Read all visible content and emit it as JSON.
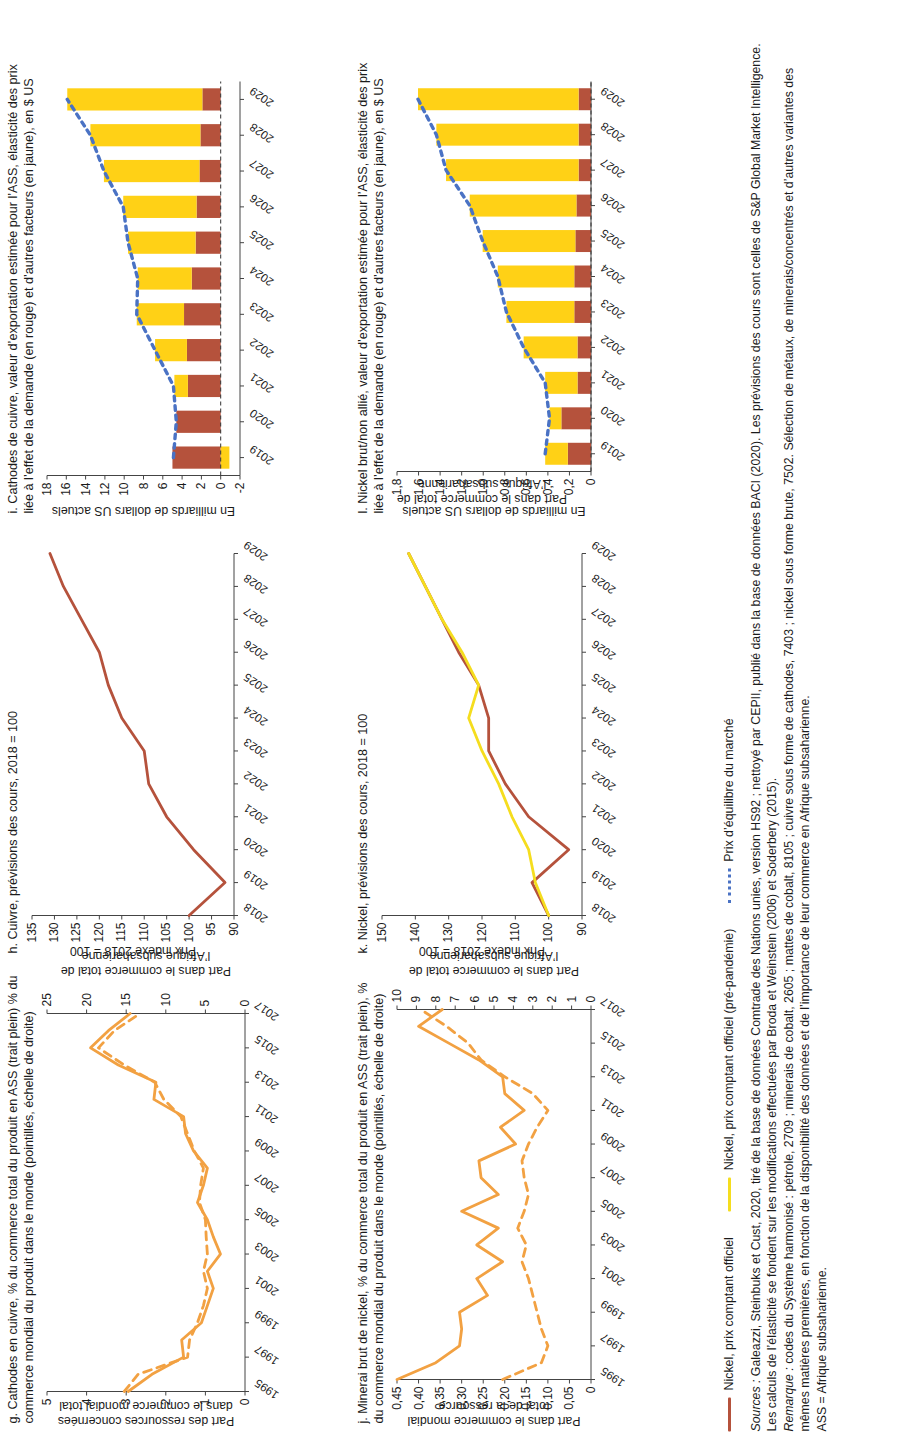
{
  "figure": {
    "legend": [
      {
        "key": "copper-spot",
        "label": "Nickel, prix comptant officiel",
        "color": "#b5523c",
        "style": "solid"
      },
      {
        "key": "nickel-spot-yellow",
        "label": "Nickel, prix comptant officiel (pré-pandémie)",
        "color": "#f5dd1e",
        "style": "solid"
      },
      {
        "key": "equilibrium",
        "label": "Prix d’équilibre du marché",
        "color": "#4a72c4",
        "style": "dotted"
      }
    ],
    "notes": {
      "sources_label": "Sources :",
      "sources_text": " Galeazzi, Steinbuks et Cust, 2020, tiré de la base de données Comtrade des Nations unies, version HS92 ; nettoyé par CEPII, publié dans la base de données BACI (2020). Les prévisions des cours sont celles de S&P Global Market Intelligence. Les calculs de l’élasticité se fondent sur les modifications effectuées par Broda et Weinstein (2006) et Soderbery (2015).",
      "remark_label": "Remarque :",
      "remark_text": " codes du Système harmonisé : pétrole, 2709 ; minerais de cobalt, 2605 ; mattes de cobalt, 8105 ; cuivre sous forme de cathodes, 7403 ; nickel sous forme brute, 7502. Sélection de métaux, de minerais/concentrés et d’autres variantes des mêmes matières premières, en fonction de la disponibilité des données et de l’importance de leur commerce en Afrique subsaharienne.",
      "abbrev": "ASS = Afrique subsaharienne."
    }
  },
  "chart_data": [
    {
      "id": "panel-g",
      "type": "line",
      "title": "g. Cathodes en cuivre, % du commerce total du produit en ASS (trait plein) % du commerce mondial du produit dans le monde (pointillés, échelle de droite)",
      "ylabel_left": "Part des ressources concernées\ndans le commerce mondial total",
      "ylabel_right": "Part dans le commerce total de\nl’Afrique subsaharienne",
      "x": [
        1995,
        1996,
        1997,
        1998,
        1999,
        2000,
        2001,
        2002,
        2003,
        2004,
        2005,
        2006,
        2007,
        2008,
        2009,
        2010,
        2011,
        2012,
        2013,
        2014,
        2015,
        2016,
        2017
      ],
      "xticks": [
        "1995",
        "1997",
        "1999",
        "2001",
        "2003",
        "2005",
        "2007",
        "2009",
        "2011",
        "2013",
        "2015",
        "2017"
      ],
      "ylim_left": [
        0,
        5
      ],
      "yticks_left": [
        0,
        1,
        2,
        3,
        4,
        5
      ],
      "ylim_right": [
        0,
        25
      ],
      "yticks_right": [
        0,
        5,
        10,
        15,
        20,
        25
      ],
      "grid": false,
      "series": [
        {
          "name": "ASS (trait plein)",
          "style": "solid",
          "color": "#f2a142",
          "axis": "left",
          "values": [
            2.95,
            2.35,
            1.55,
            1.6,
            1.1,
            0.95,
            0.8,
            0.95,
            0.62,
            0.8,
            0.95,
            1.2,
            1.05,
            0.95,
            1.3,
            1.5,
            1.55,
            2.3,
            2.25,
            3.2,
            3.9,
            3.45,
            2.9
          ]
        },
        {
          "name": "Monde (pointillés)",
          "style": "dashed",
          "color": "#f2a142",
          "axis": "left",
          "values": [
            3.05,
            2.7,
            1.45,
            1.4,
            1.2,
            1.05,
            0.95,
            1.05,
            0.95,
            0.98,
            1.0,
            1.15,
            1.12,
            1.05,
            1.28,
            1.45,
            1.62,
            2.05,
            2.28,
            3.05,
            3.7,
            3.3,
            2.65
          ]
        }
      ]
    },
    {
      "id": "panel-h",
      "type": "line",
      "title": "h. Cuivre, prévisions des cours, 2018 = 100",
      "ylabel_left": "Prix indexé 2018 = 100",
      "x": [
        2018,
        2019,
        2020,
        2021,
        2022,
        2023,
        2024,
        2025,
        2026,
        2027,
        2028,
        2029
      ],
      "xticks": [
        "2018",
        "2019",
        "2020",
        "2021",
        "2022",
        "2023",
        "2024",
        "2025",
        "2026",
        "2027",
        "2028",
        "2029"
      ],
      "ylim_left": [
        90,
        135
      ],
      "yticks_left": [
        90,
        95,
        100,
        105,
        110,
        115,
        120,
        125,
        130,
        135
      ],
      "grid": false,
      "series": [
        {
          "name": "Cuivre, prix comptant officiel",
          "style": "solid",
          "color": "#b5523c",
          "axis": "left",
          "values": [
            100,
            92,
            99,
            105,
            109,
            110,
            115,
            118,
            120,
            124,
            128,
            131
          ]
        }
      ]
    },
    {
      "id": "panel-i",
      "type": "bar",
      "title": "i. Cathodes de cuivre, valeur d’exportation estimée pour l’ASS, élasticité des prix liée à l’effet de la demande (en rouge) et d’autres facteurs (en jaune), en $ US",
      "ylabel_left": "En milliards de dollars US actuels",
      "categories": [
        "2019",
        "2020",
        "2021",
        "2022",
        "2023",
        "2024",
        "2025",
        "2026",
        "2027",
        "2028",
        "2029"
      ],
      "xticks": [
        "2019",
        "2020",
        "2021",
        "2022",
        "2023",
        "2024",
        "2025",
        "2026",
        "2027",
        "2028",
        "2029"
      ],
      "ylim_left": [
        -2,
        18
      ],
      "yticks_left": [
        -2,
        0,
        2,
        4,
        6,
        8,
        10,
        12,
        14,
        16,
        18
      ],
      "grid": false,
      "series": [
        {
          "name": "Effet de la demande (rouge)",
          "color": "#b5523c",
          "values": [
            5.0,
            4.6,
            3.4,
            3.5,
            3.8,
            3.0,
            2.6,
            2.5,
            2.2,
            2.1,
            1.9
          ]
        },
        {
          "name": "Autres facteurs (jaune)",
          "color": "#ffd116",
          "values": [
            -0.9,
            0.0,
            1.4,
            3.3,
            4.9,
            5.6,
            7.0,
            7.6,
            9.9,
            11.4,
            14.0
          ]
        },
        {
          "name": "Prix d’équilibre du marché (pointillés bleus)",
          "color": "#4a72c4",
          "style": "dotted",
          "values": [
            4.9,
            4.6,
            4.9,
            6.8,
            8.7,
            8.6,
            9.6,
            10.1,
            12.1,
            13.5,
            15.9
          ]
        }
      ]
    },
    {
      "id": "panel-j",
      "type": "line",
      "title": "j. Minerai brut de nickel, % du commerce total du produit en ASS (trait plein), % du commerce mondial du produit dans le monde (pointillés, échelle de droite)",
      "ylabel_left": "Part dans le commerce mondial\ntotal de la ressource",
      "ylabel_right": "Part dans le commerce total de\nl’Afrique subsaharienne",
      "x": [
        1995,
        1996,
        1997,
        1998,
        1999,
        2000,
        2001,
        2002,
        2003,
        2004,
        2005,
        2006,
        2007,
        2008,
        2009,
        2010,
        2011,
        2012,
        2013,
        2014,
        2015,
        2016,
        2017
      ],
      "xticks": [
        "1995",
        "1997",
        "1999",
        "2001",
        "2003",
        "2005",
        "2007",
        "2009",
        "2011",
        "2013",
        "2015",
        "2017"
      ],
      "ylim_left": [
        0,
        0.45
      ],
      "yticks_left": [
        "0",
        "0,05",
        "0,10",
        "0,15",
        "0,20",
        "0,25",
        "0,30",
        "0,35",
        "0,40",
        "0,45"
      ],
      "ylim_right": [
        0,
        10
      ],
      "yticks_right": [
        0,
        1,
        2,
        3,
        4,
        5,
        6,
        7,
        8,
        9,
        10
      ],
      "grid": false,
      "series": [
        {
          "name": "ASS (trait plein)",
          "style": "solid",
          "color": "#f2a142",
          "axis": "left",
          "values": [
            0.45,
            0.36,
            0.305,
            0.3,
            0.305,
            0.24,
            0.265,
            0.205,
            0.265,
            0.215,
            0.3,
            0.215,
            0.255,
            0.26,
            0.175,
            0.21,
            0.155,
            0.2,
            0.205,
            0.26,
            0.33,
            0.4,
            0.345
          ]
        },
        {
          "name": "Monde (pointillés)",
          "style": "dashed",
          "color": "#f2a142",
          "axis": "left",
          "values": [
            0.205,
            0.115,
            0.1,
            0.115,
            0.125,
            0.135,
            0.145,
            0.16,
            0.15,
            0.17,
            0.155,
            0.145,
            0.155,
            0.16,
            0.145,
            0.125,
            0.1,
            0.135,
            0.2,
            0.255,
            0.285,
            0.335,
            0.395
          ]
        }
      ]
    },
    {
      "id": "panel-k",
      "type": "line",
      "title": "k. Nickel, prévisions des cours, 2018 = 100",
      "ylabel_left": "Prix indexé 2018 = 100",
      "ylabel_right": "Part dans le commerce total de\nl’Afrique subsaharienne",
      "x": [
        2018,
        2019,
        2020,
        2021,
        2022,
        2023,
        2024,
        2025,
        2026,
        2027,
        2028,
        2029
      ],
      "xticks": [
        "2018",
        "2019",
        "2020",
        "2021",
        "2022",
        "2023",
        "2024",
        "2025",
        "2026",
        "2027",
        "2028",
        "2029"
      ],
      "ylim_left": [
        90,
        150
      ],
      "yticks_left": [
        90,
        100,
        110,
        120,
        130,
        140,
        150
      ],
      "grid": false,
      "series": [
        {
          "name": "Nickel, prix comptant officiel",
          "style": "solid",
          "color": "#b5523c",
          "axis": "left",
          "values": [
            100,
            105,
            94,
            106,
            113,
            118,
            118,
            121,
            127,
            132,
            137,
            142
          ]
        },
        {
          "name": "Nickel, prix comptant officiel (pré-pandémie)",
          "style": "solid",
          "color": "#f5dd1e",
          "axis": "left",
          "values": [
            100,
            104,
            106,
            111,
            115,
            120,
            124,
            121,
            126,
            132,
            137,
            142
          ]
        }
      ]
    },
    {
      "id": "panel-l",
      "type": "bar",
      "title": "l. Nickel brut/non allié, valeur d’exportation estimée pour l’ASS, élasticité des prix liée à l’effet de la demande (en rouge) et d’autres facteurs (en jaune), en $ US",
      "ylabel_left": "En milliards de dollars US actuels",
      "categories": [
        "2019",
        "2020",
        "2021",
        "2022",
        "2023",
        "2024",
        "2025",
        "2026",
        "2027",
        "2028",
        "2029"
      ],
      "xticks": [
        "2019",
        "2020",
        "2021",
        "2022",
        "2023",
        "2024",
        "2025",
        "2026",
        "2027",
        "2028",
        "2029"
      ],
      "ylim_left": [
        0,
        1.8
      ],
      "yticks_left": [
        "0",
        "0,2",
        "0,4",
        "0,6",
        "0,8",
        "1,0",
        "1,2",
        "1,4",
        "1,6",
        "1,8"
      ],
      "grid": false,
      "series": [
        {
          "name": "Effet de la demande (rouge)",
          "color": "#b5523c",
          "values": [
            0.215,
            0.275,
            0.125,
            0.125,
            0.155,
            0.155,
            0.145,
            0.135,
            0.115,
            0.115,
            0.115
          ]
        },
        {
          "name": "Autres facteurs (jaune)",
          "color": "#ffd116",
          "values": [
            0.21,
            0.11,
            0.3,
            0.5,
            0.63,
            0.71,
            0.86,
            0.99,
            1.23,
            1.32,
            1.49
          ]
        },
        {
          "name": "Prix d’équilibre du marché (pointillés bleus)",
          "color": "#4a72c4",
          "style": "dotted",
          "values": [
            0.425,
            0.385,
            0.425,
            0.625,
            0.785,
            0.865,
            1.005,
            1.125,
            1.345,
            1.435,
            1.605
          ]
        }
      ]
    }
  ]
}
